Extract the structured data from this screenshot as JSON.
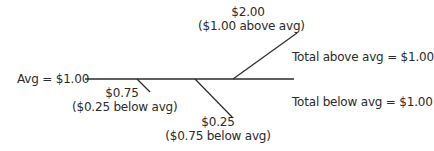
{
  "diagram": {
    "avg_label": "Avg = $1.00",
    "points": [
      {
        "value": "$0.75",
        "note": "($0.25 below avg)",
        "direction": "below"
      },
      {
        "value": "$0.25",
        "note": "($0.75 below avg)",
        "direction": "below"
      },
      {
        "value": "$2.00",
        "note": "($1.00 above avg)",
        "direction": "above"
      }
    ],
    "total_above": "Total above avg = $1.00",
    "total_below": "Total below avg = $1.00",
    "line_color": "#2a2a2a"
  }
}
